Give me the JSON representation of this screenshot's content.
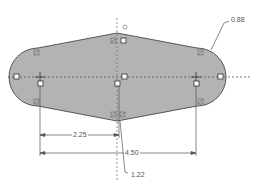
{
  "sketch": {
    "fill_color": "#b3b3b3",
    "outline_color": "#555555",
    "centerline_color": "#555555",
    "dimension_color": "#555555"
  },
  "dimensions": {
    "radius_label": "0.88",
    "half_distance_label": "2.25",
    "full_distance_label": "4.50",
    "height_label": "1.22"
  },
  "markers": {
    "relation_icon": "sketch-relation-icon",
    "endpoint_icon": "sketch-point-icon"
  }
}
